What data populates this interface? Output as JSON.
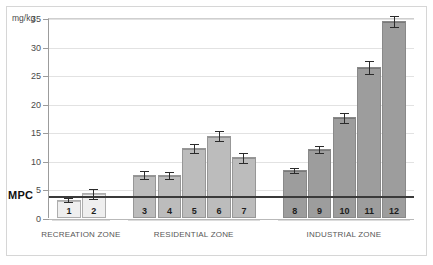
{
  "axis": {
    "unit_label": "mg/kg",
    "threshold_label": "MPC",
    "threshold_value": 4,
    "ticks": [
      0,
      5,
      10,
      15,
      20,
      25,
      30,
      35
    ]
  },
  "chart_data": {
    "type": "bar",
    "title": "",
    "xlabel": "",
    "ylabel": "mg/kg",
    "ylim": [
      0,
      35
    ],
    "grid": true,
    "legend": "none",
    "categories": [
      "1",
      "2",
      "3",
      "4",
      "5",
      "6",
      "7",
      "8",
      "9",
      "10",
      "11",
      "12"
    ],
    "values": [
      3.2,
      4.3,
      7.6,
      7.5,
      12.2,
      14.4,
      10.6,
      8.4,
      12.0,
      17.6,
      26.4,
      34.5
    ],
    "errors": [
      0.4,
      0.9,
      0.8,
      0.7,
      0.9,
      1.0,
      0.9,
      0.6,
      0.7,
      0.9,
      1.2,
      1.1
    ],
    "annotations": [
      {
        "label": "MPC",
        "value": 4,
        "type": "threshold-line"
      }
    ],
    "groups": [
      {
        "name": "RECREATION ZONE",
        "bars": [
          "1",
          "2"
        ],
        "color": "#efefef"
      },
      {
        "name": "RESIDENTIAL ZONE",
        "bars": [
          "3",
          "4",
          "5",
          "6",
          "7"
        ],
        "color": "#bcbcbc"
      },
      {
        "name": "INDUSTRIAL ZONE",
        "bars": [
          "8",
          "9",
          "10",
          "11",
          "12"
        ],
        "color": "#9d9d9d"
      }
    ]
  }
}
